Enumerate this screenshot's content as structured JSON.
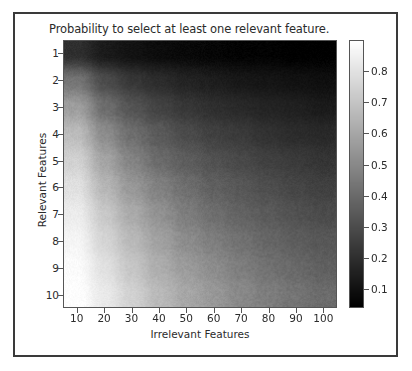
{
  "figure": {
    "title": "Probability to select at least one relevant feature.",
    "border_color": "#3a3a3a",
    "background": "#ffffff"
  },
  "axes": {
    "xlabel": "Irrelevant Features",
    "ylabel": "Relevant Features",
    "xticks": [
      10,
      20,
      30,
      40,
      50,
      60,
      70,
      80,
      90,
      100
    ],
    "yticks": [
      1,
      2,
      3,
      4,
      5,
      6,
      7,
      8,
      9,
      10
    ]
  },
  "colorbar": {
    "ticks": [
      0.1,
      0.2,
      0.3,
      0.4,
      0.5,
      0.6,
      0.7,
      0.8
    ],
    "tick_labels": [
      "0.1",
      "0.2",
      "0.3",
      "0.4",
      "0.5",
      "0.6",
      "0.7",
      "0.8"
    ],
    "vmin": 0.04,
    "vmax": 0.9,
    "low_color": "#000000",
    "high_color": "#ffffff",
    "orientation": "vertical"
  },
  "chart_data": {
    "type": "heatmap",
    "title": "Probability to select at least one relevant feature.",
    "xlabel": "Irrelevant Features",
    "ylabel": "Relevant Features",
    "colormap": "gray",
    "x": [
      10,
      20,
      30,
      40,
      50,
      60,
      70,
      80,
      90,
      100
    ],
    "y": [
      1,
      2,
      3,
      4,
      5,
      6,
      7,
      8,
      9,
      10
    ],
    "xlim": [
      10,
      100
    ],
    "ylim": [
      10,
      1
    ],
    "zlim": [
      0.04,
      0.9
    ],
    "grid": false,
    "legend": "colorbar-right",
    "z_description": "rows = relevant features 1..10 (top to bottom), cols = irrelevant features 10..100 (left to right)",
    "values": [
      [
        0.2,
        0.13,
        0.1,
        0.08,
        0.07,
        0.06,
        0.05,
        0.05,
        0.04,
        0.04
      ],
      [
        0.44,
        0.3,
        0.23,
        0.19,
        0.16,
        0.14,
        0.12,
        0.11,
        0.1,
        0.09
      ],
      [
        0.58,
        0.42,
        0.33,
        0.27,
        0.23,
        0.2,
        0.18,
        0.16,
        0.15,
        0.13
      ],
      [
        0.68,
        0.52,
        0.42,
        0.35,
        0.3,
        0.26,
        0.24,
        0.21,
        0.19,
        0.18
      ],
      [
        0.75,
        0.6,
        0.49,
        0.41,
        0.36,
        0.32,
        0.29,
        0.26,
        0.24,
        0.22
      ],
      [
        0.8,
        0.66,
        0.56,
        0.48,
        0.42,
        0.37,
        0.34,
        0.31,
        0.28,
        0.26
      ],
      [
        0.84,
        0.72,
        0.62,
        0.54,
        0.47,
        0.42,
        0.38,
        0.35,
        0.32,
        0.3
      ],
      [
        0.87,
        0.76,
        0.67,
        0.59,
        0.52,
        0.47,
        0.43,
        0.39,
        0.36,
        0.34
      ],
      [
        0.89,
        0.8,
        0.71,
        0.63,
        0.57,
        0.52,
        0.47,
        0.43,
        0.4,
        0.37
      ],
      [
        0.9,
        0.83,
        0.75,
        0.67,
        0.61,
        0.56,
        0.51,
        0.47,
        0.44,
        0.41
      ]
    ]
  }
}
